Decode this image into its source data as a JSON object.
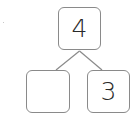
{
  "diagram": {
    "type": "number-bond",
    "whole": "4",
    "parts": [
      "",
      "3"
    ],
    "colors": {
      "border": "#8a8a8a",
      "text": "#2a2a2a",
      "line": "#8a8a8a",
      "background": "#ffffff"
    }
  }
}
